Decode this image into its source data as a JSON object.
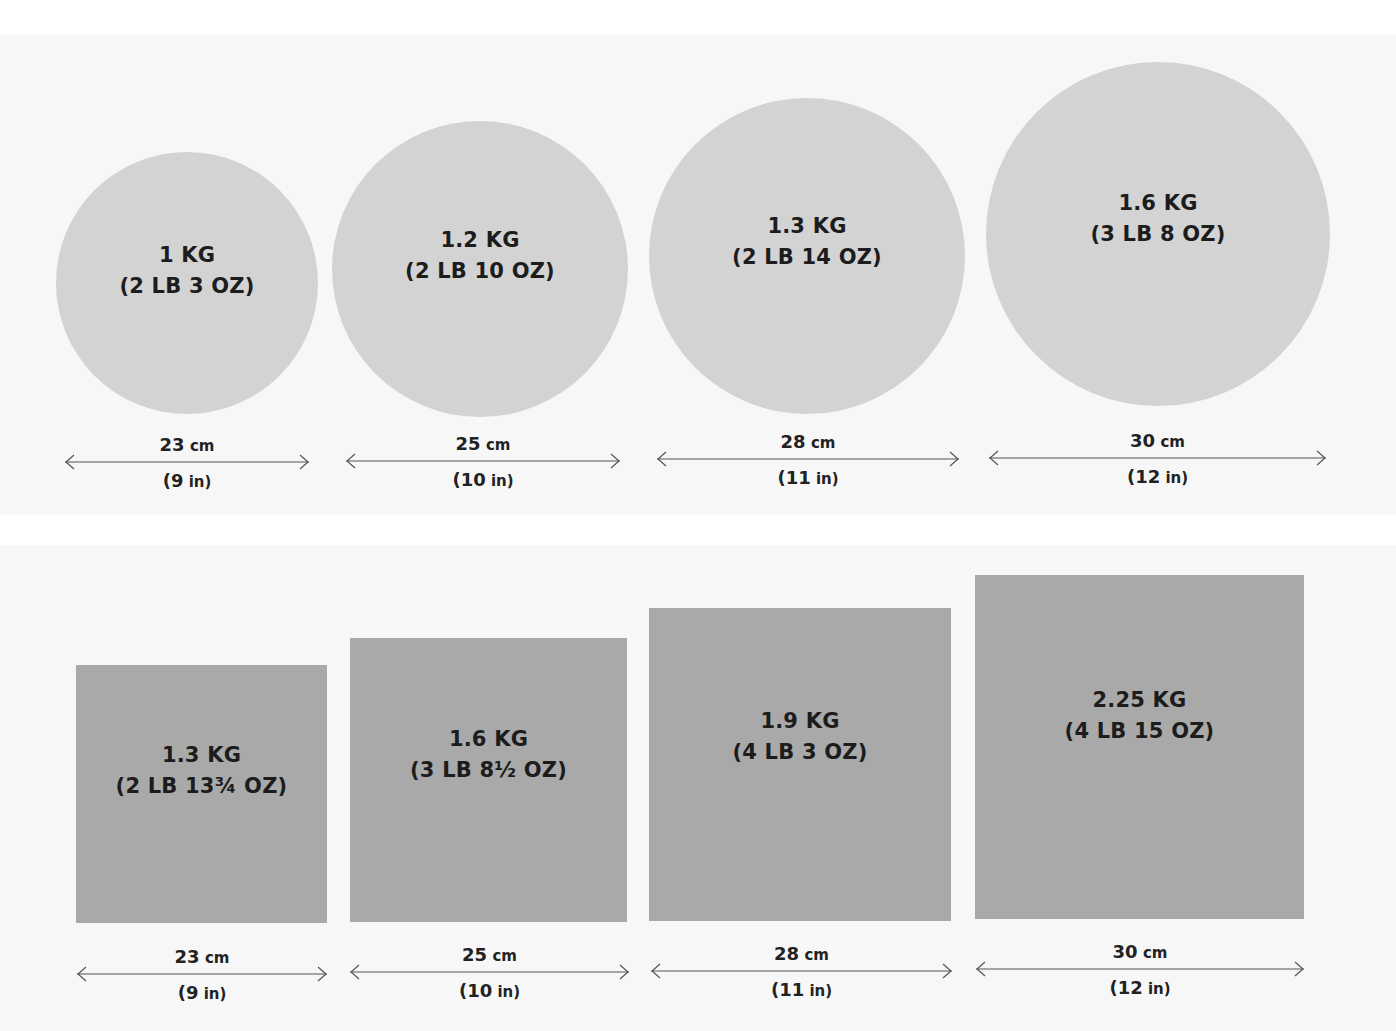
{
  "colors": {
    "background": "#ffffff",
    "panel": "#f7f7f7",
    "round_tin": "#d3d3d3",
    "square_tin": "#a9a9a9",
    "text": "#1c1c1c",
    "arrow": "#555555"
  },
  "round_tins": [
    {
      "weight_metric": "1 KG",
      "weight_imperial": "(2 LB 3 OZ)",
      "diameter_cm": "23 cm",
      "diameter_in": "(9 in)",
      "cx": 187,
      "cy": 283,
      "r": 131,
      "arrow_x1": 65,
      "arrow_x2": 309,
      "arrow_y": 462
    },
    {
      "weight_metric": "1.2 KG",
      "weight_imperial": "(2 LB 10 OZ)",
      "diameter_cm": "25 cm",
      "diameter_in": "(10 in)",
      "cx": 480,
      "cy": 269,
      "r": 148,
      "arrow_x1": 346,
      "arrow_x2": 620,
      "arrow_y": 461
    },
    {
      "weight_metric": "1.3 KG",
      "weight_imperial": "(2 LB 14 OZ)",
      "diameter_cm": "28 cm",
      "diameter_in": "(11 in)",
      "cx": 807,
      "cy": 256,
      "r": 158,
      "arrow_x1": 657,
      "arrow_x2": 959,
      "arrow_y": 459
    },
    {
      "weight_metric": "1.6 KG",
      "weight_imperial": "(3 LB 8 OZ)",
      "diameter_cm": "30 cm",
      "diameter_in": "(12 in)",
      "cx": 1158,
      "cy": 234,
      "r": 172,
      "arrow_x1": 989,
      "arrow_x2": 1326,
      "arrow_y": 458
    }
  ],
  "square_tins": [
    {
      "weight_metric": "1.3 KG",
      "weight_imperial": "(2 LB 13¾ OZ)",
      "side_cm": "23 cm",
      "side_in": "(9 in)",
      "x": 76,
      "y": 665,
      "w": 251,
      "h": 258,
      "arrow_x1": 77,
      "arrow_x2": 327,
      "arrow_y": 974
    },
    {
      "weight_metric": "1.6 KG",
      "weight_imperial": "(3 LB 8½ OZ)",
      "side_cm": "25 cm",
      "side_in": "(10 in)",
      "x": 350,
      "y": 638,
      "w": 277,
      "h": 284,
      "arrow_x1": 350,
      "arrow_x2": 629,
      "arrow_y": 972
    },
    {
      "weight_metric": "1.9 KG",
      "weight_imperial": "(4 LB 3 OZ)",
      "side_cm": "28 cm",
      "side_in": "(11 in)",
      "x": 649,
      "y": 608,
      "w": 302,
      "h": 313,
      "arrow_x1": 651,
      "arrow_x2": 952,
      "arrow_y": 971
    },
    {
      "weight_metric": "2.25 KG",
      "weight_imperial": "(4 LB 15 OZ)",
      "side_cm": "30 cm",
      "side_in": "(12 in)",
      "x": 975,
      "y": 575,
      "w": 329,
      "h": 344,
      "arrow_x1": 976,
      "arrow_x2": 1304,
      "arrow_y": 969
    }
  ]
}
